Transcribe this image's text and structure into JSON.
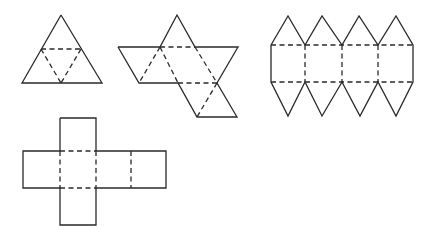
{
  "figure": {
    "line_color": "#2a2a2a",
    "background": "#ffffff"
  },
  "nets": [
    {
      "name": "tetrahedron-net",
      "solid": [
        [
          [
            61,
            15
          ],
          [
            102,
            83
          ],
          [
            22,
            83
          ],
          [
            61,
            15
          ]
        ]
      ],
      "dashed": [
        [
          [
            41,
            49
          ],
          [
            81,
            49
          ]
        ],
        [
          [
            41,
            49
          ],
          [
            61,
            83
          ]
        ],
        [
          [
            81,
            49
          ],
          [
            61,
            83
          ]
        ]
      ]
    },
    {
      "name": "octahedron-net",
      "solid": [
        [
          [
            118,
            47
          ],
          [
            160,
            47
          ],
          [
            177,
            15
          ],
          [
            195,
            47
          ],
          [
            238,
            47
          ],
          [
            217,
            83
          ],
          [
            237,
            117
          ],
          [
            197,
            117
          ],
          [
            178,
            83
          ],
          [
            139,
            83
          ],
          [
            118,
            47
          ]
        ]
      ],
      "dashed": [
        [
          [
            160,
            47
          ],
          [
            195,
            47
          ]
        ],
        [
          [
            160,
            47
          ],
          [
            139,
            83
          ]
        ],
        [
          [
            160,
            47
          ],
          [
            178,
            83
          ]
        ],
        [
          [
            195,
            47
          ],
          [
            217,
            83
          ]
        ],
        [
          [
            178,
            83
          ],
          [
            217,
            83
          ]
        ],
        [
          [
            217,
            83
          ],
          [
            197,
            117
          ]
        ]
      ]
    },
    {
      "name": "strip-net",
      "solid": [
        [
          [
            271,
            45
          ],
          [
            288,
            16
          ],
          [
            305,
            45
          ],
          [
            322,
            16
          ],
          [
            342,
            45
          ],
          [
            359,
            16
          ],
          [
            378,
            45
          ],
          [
            396,
            16
          ],
          [
            413,
            45
          ],
          [
            413,
            82
          ],
          [
            396,
            116
          ],
          [
            378,
            82
          ],
          [
            360,
            116
          ],
          [
            342,
            82
          ],
          [
            322,
            116
          ],
          [
            305,
            82
          ],
          [
            288,
            116
          ],
          [
            271,
            82
          ],
          [
            271,
            45
          ]
        ]
      ],
      "dashed": [
        [
          [
            271,
            45
          ],
          [
            413,
            45
          ]
        ],
        [
          [
            271,
            82
          ],
          [
            413,
            82
          ]
        ],
        [
          [
            305,
            45
          ],
          [
            305,
            82
          ]
        ],
        [
          [
            342,
            45
          ],
          [
            342,
            82
          ]
        ],
        [
          [
            378,
            45
          ],
          [
            378,
            82
          ]
        ]
      ]
    },
    {
      "name": "cube-net",
      "solid": [
        [
          [
            60,
            118
          ],
          [
            96,
            118
          ],
          [
            96,
            151
          ],
          [
            166,
            151
          ],
          [
            166,
            188
          ],
          [
            96,
            188
          ],
          [
            96,
            225
          ],
          [
            60,
            225
          ],
          [
            60,
            188
          ],
          [
            23,
            188
          ],
          [
            23,
            151
          ],
          [
            60,
            151
          ],
          [
            60,
            118
          ]
        ]
      ],
      "dashed": [
        [
          [
            60,
            151
          ],
          [
            96,
            151
          ]
        ],
        [
          [
            60,
            188
          ],
          [
            96,
            188
          ]
        ],
        [
          [
            60,
            151
          ],
          [
            60,
            188
          ]
        ],
        [
          [
            96,
            151
          ],
          [
            96,
            188
          ]
        ],
        [
          [
            131,
            151
          ],
          [
            131,
            188
          ]
        ]
      ]
    }
  ]
}
